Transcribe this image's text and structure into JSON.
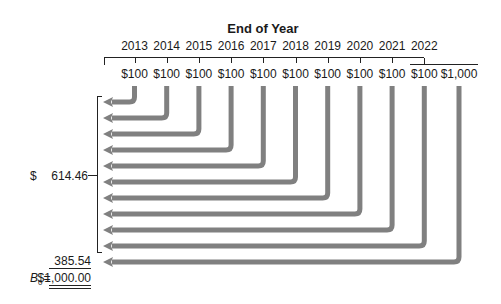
{
  "diagram": {
    "title": "End of Year",
    "years": [
      "2013",
      "2014",
      "2015",
      "2016",
      "2017",
      "2018",
      "2019",
      "2020",
      "2021",
      "2022"
    ],
    "payments": [
      "$100",
      "$100",
      "$100",
      "$100",
      "$100",
      "$100",
      "$100",
      "$100",
      "$100",
      "$100",
      "$1,000"
    ],
    "coupon_pv_sum": {
      "currency": "$",
      "value": "614.46"
    },
    "principal_pv": "385.54",
    "bond_value": {
      "symbol": "B",
      "subscript": "0",
      "equals": "=",
      "value": "$1,000.00"
    }
  },
  "colors": {
    "arrow": "#808080",
    "line": "#222222",
    "text": "#1a1a1a"
  }
}
